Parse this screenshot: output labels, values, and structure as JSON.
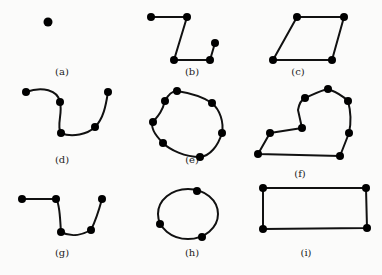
{
  "figure": {
    "panels": [
      {
        "id": "a",
        "label": "(a)",
        "shape": "single-point",
        "points": [
          [
            48,
            22
          ]
        ],
        "closed": false,
        "curved": false,
        "label_pos": [
          62,
          75
        ]
      },
      {
        "id": "b",
        "label": "(b)",
        "shape": "open-polyline",
        "points": [
          [
            151,
            17
          ],
          [
            187,
            17
          ],
          [
            174,
            60
          ],
          [
            210,
            60
          ],
          [
            215,
            43
          ]
        ],
        "closed": false,
        "curved": false,
        "label_pos": [
          192,
          75
        ]
      },
      {
        "id": "c",
        "label": "(c)",
        "shape": "parallelogram",
        "points": [
          [
            297,
            17
          ],
          [
            344,
            17
          ],
          [
            332,
            60
          ],
          [
            273,
            60
          ]
        ],
        "closed": true,
        "curved": false,
        "label_pos": [
          298,
          75
        ]
      },
      {
        "id": "d",
        "label": "(d)",
        "shape": "open-curve",
        "points": [
          [
            26,
            92
          ],
          [
            60,
            102
          ],
          [
            61,
            133
          ],
          [
            95,
            127
          ],
          [
            108,
            92
          ]
        ],
        "closed": false,
        "curved": true,
        "label_pos": [
          62,
          163
        ]
      },
      {
        "id": "e",
        "label": "(e)",
        "shape": "closed-curve",
        "points": [
          [
            177,
            91
          ],
          [
            212,
            103
          ],
          [
            222,
            133
          ],
          [
            200,
            157
          ],
          [
            163,
            143
          ],
          [
            153,
            122
          ],
          [
            165,
            101
          ]
        ],
        "closed": true,
        "curved": true,
        "label_pos": [
          192,
          163
        ]
      },
      {
        "id": "f",
        "label": "(f)",
        "shape": "mixed-closed",
        "points": [
          [
            328,
            89
          ],
          [
            348,
            101
          ],
          [
            349,
            133
          ],
          [
            340,
            156
          ],
          [
            258,
            154
          ],
          [
            270,
            133
          ],
          [
            302,
            128
          ],
          [
            305,
            98
          ]
        ],
        "closed": true,
        "curved": false,
        "label_pos": [
          300,
          177
        ]
      },
      {
        "id": "g",
        "label": "(g)",
        "shape": "open-curve-mixed",
        "points": [
          [
            22,
            199
          ],
          [
            56,
            199
          ],
          [
            61,
            232
          ],
          [
            91,
            230
          ],
          [
            102,
            199
          ]
        ],
        "closed": false,
        "curved": false,
        "label_pos": [
          62,
          256
        ]
      },
      {
        "id": "h",
        "label": "(h)",
        "shape": "ellipse",
        "ellipse": {
          "cx": 188,
          "cy": 214,
          "rx": 30,
          "ry": 26
        },
        "points": [
          [
            197,
            191
          ],
          [
            160,
            224
          ],
          [
            202,
            237
          ]
        ],
        "closed": true,
        "curved": true,
        "label_pos": [
          192,
          256
        ]
      },
      {
        "id": "i",
        "label": "(i)",
        "shape": "rectangle",
        "points": [
          [
            263,
            188
          ],
          [
            366,
            188
          ],
          [
            367,
            228
          ],
          [
            263,
            229
          ]
        ],
        "closed": true,
        "curved": false,
        "label_pos": [
          306,
          256
        ]
      }
    ]
  }
}
